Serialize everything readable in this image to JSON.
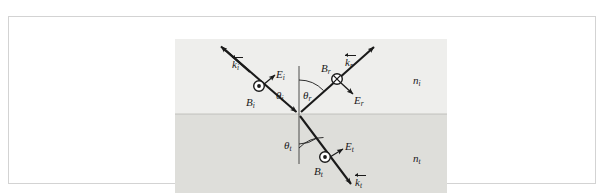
{
  "top_strip": {
    "clipped_text": "― ― ― ― ― ― ― ― ― ― ―"
  },
  "figure": {
    "media": {
      "incident_label": "n",
      "incident_sub": "i",
      "transmitted_label": "n",
      "transmitted_sub": "t"
    },
    "rays": [
      {
        "id": "incident",
        "wavevector_label": "k",
        "wavevector_sub": "i",
        "e_field_label": "E",
        "e_field_sub": "i",
        "b_field_label": "B",
        "b_field_sub": "i",
        "b_field_symbol": "dot-out-of-page",
        "angle_label": "θ",
        "angle_sub": "i"
      },
      {
        "id": "reflected",
        "wavevector_label": "k",
        "wavevector_sub": "r",
        "e_field_label": "E",
        "e_field_sub": "r",
        "b_field_label": "B",
        "b_field_sub": "r",
        "b_field_symbol": "cross-into-page",
        "angle_label": "θ",
        "angle_sub": "r"
      },
      {
        "id": "transmitted",
        "wavevector_label": "k",
        "wavevector_sub": "t",
        "e_field_label": "E",
        "e_field_sub": "t",
        "b_field_label": "B",
        "b_field_sub": "t",
        "b_field_symbol": "dot-out-of-page",
        "angle_label": "θ",
        "angle_sub": "t"
      }
    ],
    "colors": {
      "ink": "#1a1a1a",
      "medium_incident_fill": "#eeeeec",
      "medium_transmitted_fill": "#dededa",
      "frame_border": "#d3d3d3",
      "page_background": "#ffffff"
    }
  }
}
